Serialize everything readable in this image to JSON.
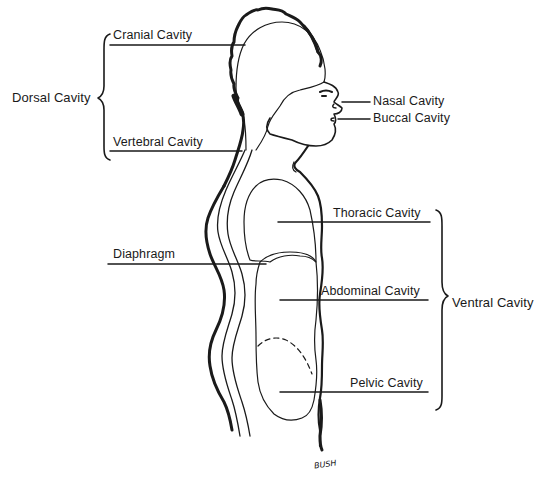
{
  "diagram": {
    "type": "anatomical-line-drawing",
    "colors": {
      "ink": "#1a1a1a",
      "background": "#ffffff"
    },
    "groups": [
      {
        "label": "Dorsal Cavity",
        "side": "left",
        "members": [
          "Cranial Cavity",
          "Vertebral Cavity"
        ]
      },
      {
        "label": "Ventral Cavity",
        "side": "right",
        "members": [
          "Thoracic Cavity",
          "Abdominal Cavity",
          "Pelvic Cavity"
        ]
      }
    ],
    "labels": {
      "cranial": "Cranial Cavity",
      "vertebral": "Vertebral Cavity",
      "dorsal": "Dorsal Cavity",
      "nasal": "Nasal Cavity",
      "buccal": "Buccal Cavity",
      "thoracic": "Thoracic Cavity",
      "diaphragm": "Diaphragm",
      "abdominal": "Abdominal Cavity",
      "pelvic": "Pelvic Cavity",
      "ventral": "Ventral Cavity"
    },
    "signature": "BUSH"
  }
}
